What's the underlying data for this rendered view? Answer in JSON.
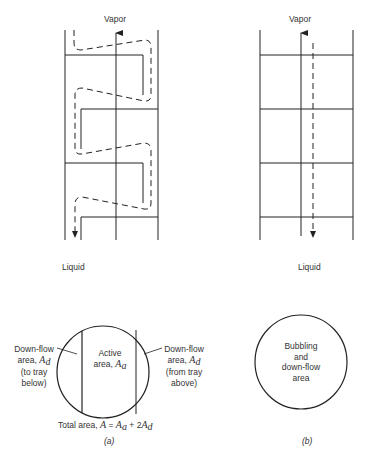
{
  "panel_a": {
    "column": {
      "top_label": "Vapor",
      "bottom_label": "Liquid"
    },
    "cross_section": {
      "left_label_line1": "Down-flow",
      "left_label_line2": "area, ",
      "left_label_symbol": "A",
      "left_label_sub": "d",
      "left_label_line3": "(to tray",
      "left_label_line4": "below)",
      "center_label_line1": "Active",
      "center_label_line2": "area, ",
      "center_label_symbol": "A",
      "center_label_sub": "a",
      "right_label_line1": "Down-flow",
      "right_label_line2": "area, ",
      "right_label_symbol": "A",
      "right_label_sub": "d",
      "right_label_line3": "(from tray",
      "right_label_line4": "above)",
      "total_prefix": "Total area, ",
      "total_A": "A",
      "total_eq": " = ",
      "total_Aa": "A",
      "total_Aa_sub": "a",
      "total_plus": " + 2",
      "total_Ad": "A",
      "total_Ad_sub": "d"
    },
    "caption": "(a)"
  },
  "panel_b": {
    "column": {
      "top_label": "Vapor",
      "bottom_label": "Liquid"
    },
    "cross_section": {
      "label_line1": "Bubbling",
      "label_line2": "and",
      "label_line3": "down-flow",
      "label_line4": "area"
    },
    "caption": "(b)"
  }
}
